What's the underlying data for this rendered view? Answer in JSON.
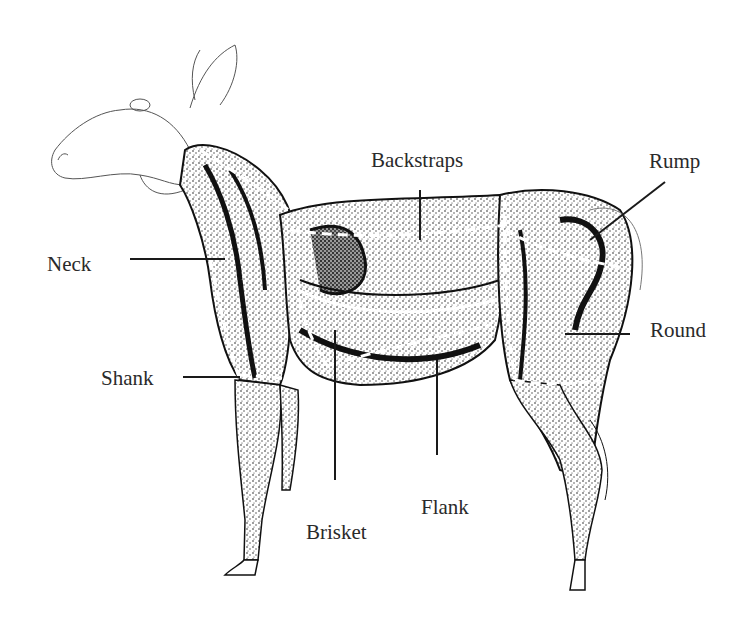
{
  "diagram": {
    "colors": {
      "ink": "#1a1a1a",
      "label_text": "#2a2a2a",
      "background": "#ffffff"
    },
    "labels": [
      {
        "id": "backstraps",
        "text": "Backstraps"
      },
      {
        "id": "rump",
        "text": "Rump"
      },
      {
        "id": "neck",
        "text": "Neck"
      },
      {
        "id": "round",
        "text": "Round"
      },
      {
        "id": "shank",
        "text": "Shank"
      },
      {
        "id": "brisket",
        "text": "Brisket"
      },
      {
        "id": "flank",
        "text": "Flank"
      }
    ]
  }
}
